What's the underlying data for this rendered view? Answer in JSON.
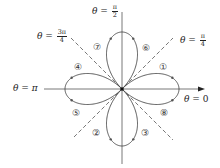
{
  "diagram": {
    "origin": [
      122,
      89
    ],
    "petal_radius": 57,
    "stroke_color": "#444444",
    "axis_labels": {
      "theta_0": {
        "prefix": "θ = ",
        "value": "0"
      },
      "theta_pi": {
        "prefix": "θ = ",
        "value": "π"
      },
      "theta_pi_2": {
        "prefix": "θ = ",
        "num": "π",
        "den": "2"
      },
      "theta_pi_4": {
        "prefix": "θ = ",
        "num": "π",
        "den": "4"
      },
      "theta_3pi_4": {
        "prefix": "θ = ",
        "num": "3π",
        "den": "4"
      }
    },
    "segments": [
      {
        "label": "①",
        "x": 163,
        "y": 67
      },
      {
        "label": "②",
        "x": 96,
        "y": 133
      },
      {
        "label": "③",
        "x": 145,
        "y": 133
      },
      {
        "label": "④",
        "x": 78,
        "y": 67
      },
      {
        "label": "⑤",
        "x": 76,
        "y": 113
      },
      {
        "label": "⑥",
        "x": 146,
        "y": 48
      },
      {
        "label": "⑦",
        "x": 97,
        "y": 47
      },
      {
        "label": "⑧",
        "x": 164,
        "y": 113
      }
    ]
  }
}
